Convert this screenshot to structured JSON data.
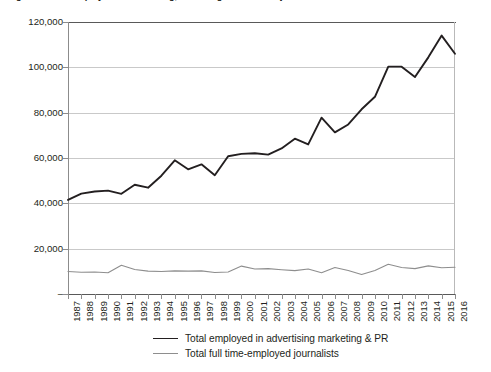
{
  "chart_data": {
    "type": "line",
    "title": "Figure 1: Total employed in advertising, marketing & PR versus journalists",
    "xlabel": "",
    "ylabel": "",
    "grid": true,
    "legend_position": "bottom",
    "ylim": [
      0,
      120000
    ],
    "ytick_labels": [
      "120,000",
      "100,000",
      "80,000",
      "60,000",
      "40,000",
      "20,000",
      "–"
    ],
    "ytick_values": [
      120000,
      100000,
      80000,
      60000,
      40000,
      20000,
      0
    ],
    "zero_label": "–",
    "categories": [
      "1987",
      "1988",
      "1989",
      "1990",
      "1991",
      "1992",
      "1993",
      "1994",
      "1995",
      "1996",
      "1997",
      "1998",
      "1999",
      "2000",
      "2001",
      "2002",
      "2003",
      "2004",
      "2005",
      "2006",
      "2007",
      "2008",
      "2009",
      "2010",
      "2011",
      "2012",
      "2013",
      "2014",
      "2015",
      "2016"
    ],
    "series": [
      {
        "name": "Total employed in advertising marketing & PR",
        "color": "#231f20",
        "width": 1.9,
        "values": [
          41500,
          44300,
          45200,
          45600,
          44200,
          48200,
          46900,
          52200,
          59000,
          55000,
          57200,
          52400,
          60800,
          61800,
          62100,
          61500,
          64200,
          68500,
          66000,
          77800,
          71300,
          74800,
          81500,
          87000,
          100300,
          100300,
          95700,
          104400,
          114000,
          106000
        ]
      },
      {
        "name": "Total full time-employed journalists",
        "color": "#8e8e8e",
        "width": 1.1,
        "values": [
          9900,
          9600,
          9700,
          9400,
          12700,
          10800,
          10100,
          9900,
          10200,
          10100,
          10200,
          9500,
          9700,
          12300,
          11000,
          11200,
          10700,
          10300,
          11000,
          9400,
          11700,
          10400,
          8600,
          10400,
          13100,
          11700,
          11200,
          12400,
          11600,
          11800
        ]
      }
    ]
  },
  "legend": {
    "items": [
      {
        "label": "Total employed in advertising marketing & PR",
        "style": "thick"
      },
      {
        "label": "Total full time-employed journalists",
        "style": "thin"
      }
    ]
  },
  "colors": {
    "series_primary": "#231f20",
    "series_secondary": "#8e8e8e",
    "gridline": "#c9c9c9",
    "axis": "#595959",
    "background": "#ffffff"
  }
}
